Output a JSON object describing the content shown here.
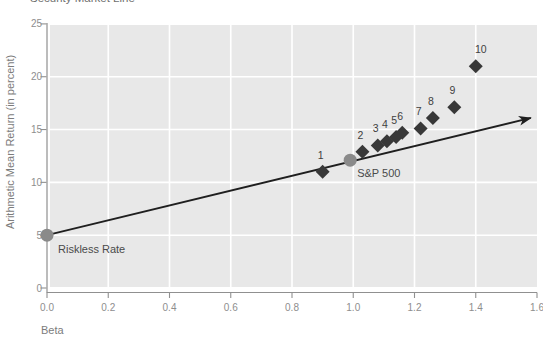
{
  "figure": {
    "title": "Security Market Line"
  },
  "colors": {
    "plot_bg": "#e8e8e8",
    "grid": "#ffffff",
    "axis": "#909090",
    "tick_text": "#8e8e8e",
    "axis_title_text": "#7c7c7c",
    "point_color": "#383838",
    "point_label_text": "#3f3f3f",
    "benchmark_color": "#8a8a8a",
    "benchmark_label_text": "#4a4a4a",
    "sml_line": "#1f1f1f"
  },
  "chart_data": {
    "type": "scatter",
    "title": "Security Market Line",
    "xlabel": "Beta",
    "ylabel": "Arithmetic Mean Return (in percent)",
    "xlim": [
      0.0,
      1.6
    ],
    "ylim": [
      0,
      25
    ],
    "x_ticks": [
      "0.0",
      "0.2",
      "0.4",
      "0.6",
      "0.8",
      "1.0",
      "1.2",
      "1.4",
      "1.6"
    ],
    "y_ticks": [
      "0",
      "5",
      "10",
      "15",
      "20",
      "25"
    ],
    "grid": true,
    "legend": "none",
    "series": [
      {
        "name": "portfolios-1-to-10",
        "marker": "diamond",
        "points": [
          {
            "label": "1",
            "beta": 0.9,
            "return": 11.0
          },
          {
            "label": "2",
            "beta": 1.03,
            "return": 12.9
          },
          {
            "label": "3",
            "beta": 1.08,
            "return": 13.5
          },
          {
            "label": "4",
            "beta": 1.11,
            "return": 13.9
          },
          {
            "label": "5",
            "beta": 1.14,
            "return": 14.3
          },
          {
            "label": "6",
            "beta": 1.16,
            "return": 14.7
          },
          {
            "label": "7",
            "beta": 1.22,
            "return": 15.1
          },
          {
            "label": "8",
            "beta": 1.26,
            "return": 16.1
          },
          {
            "label": "9",
            "beta": 1.33,
            "return": 17.1
          },
          {
            "label": "10",
            "beta": 1.4,
            "return": 21.0
          }
        ]
      },
      {
        "name": "benchmarks",
        "marker": "circle",
        "points": [
          {
            "label": "Riskless Rate",
            "beta": 0.0,
            "return": 5.0
          },
          {
            "label": "S&P 500",
            "beta": 0.99,
            "return": 12.1
          }
        ]
      }
    ],
    "sml_line": {
      "from": {
        "beta": 0.0,
        "return": 5.0
      },
      "to": {
        "beta": 1.58,
        "return": 16.1
      },
      "arrow": true
    }
  }
}
